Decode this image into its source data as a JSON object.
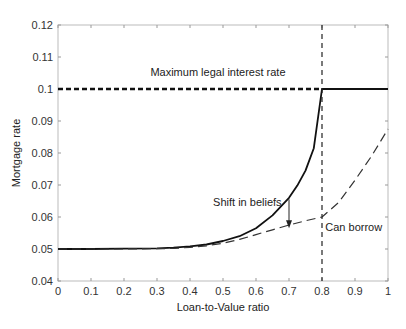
{
  "chart_data": {
    "type": "line",
    "title": "",
    "xlabel": "Loan-to-Value ratio",
    "ylabel": "Mortgage rate",
    "xlim": [
      0,
      1
    ],
    "ylim": [
      0.04,
      0.12
    ],
    "grid": false,
    "legend": "none",
    "x_ticks": [
      "0",
      "0.1",
      "0.2",
      "0.3",
      "0.4",
      "0.5",
      "0.6",
      "0.7",
      "0.8",
      "0.9",
      "1"
    ],
    "y_ticks": [
      "0.04",
      "0.05",
      "0.06",
      "0.07",
      "0.08",
      "0.09",
      "0.1",
      "0.11",
      "0.12"
    ],
    "series": [
      {
        "name": "Mortgage rate (before shift in beliefs)",
        "style": "solid",
        "x": [
          0,
          0.1,
          0.2,
          0.3,
          0.35,
          0.4,
          0.45,
          0.5,
          0.55,
          0.6,
          0.65,
          0.7,
          0.725,
          0.75,
          0.775,
          0.8,
          0.9,
          1.0
        ],
        "y": [
          0.05,
          0.05,
          0.0501,
          0.0502,
          0.0504,
          0.0508,
          0.0514,
          0.0525,
          0.054,
          0.0565,
          0.0605,
          0.066,
          0.0698,
          0.0745,
          0.0815,
          0.1,
          0.1,
          0.1
        ]
      },
      {
        "name": "Mortgage rate (after shift in beliefs)",
        "style": "dashed",
        "x": [
          0,
          0.1,
          0.2,
          0.3,
          0.35,
          0.4,
          0.45,
          0.5,
          0.55,
          0.6,
          0.65,
          0.7,
          0.75,
          0.8,
          0.85,
          0.9,
          0.95,
          1.0
        ],
        "y": [
          0.05,
          0.05,
          0.05,
          0.0501,
          0.0502,
          0.0505,
          0.051,
          0.0518,
          0.053,
          0.0545,
          0.056,
          0.0575,
          0.0588,
          0.06,
          0.0645,
          0.0715,
          0.079,
          0.0875
        ]
      },
      {
        "name": "Maximum legal interest rate",
        "style": "dotted",
        "x": [
          0,
          0.8
        ],
        "y": [
          0.1,
          0.1
        ]
      }
    ],
    "reference_lines": [
      {
        "type": "vertical",
        "x": 0.8,
        "style": "dashed",
        "label": "Can borrow"
      }
    ],
    "annotations": [
      {
        "text": "Maximum legal interest rate",
        "x": 0.28,
        "y": 0.104
      },
      {
        "text": "Shift in beliefs",
        "x": 0.47,
        "y": 0.0635
      },
      {
        "text": "Can borrow",
        "x": 0.81,
        "y": 0.0555
      },
      {
        "type": "arrow",
        "x": 0.7,
        "y_from": 0.0655,
        "y_to": 0.0565
      }
    ]
  },
  "labels": {
    "max_rate": "Maximum legal interest rate",
    "shift": "Shift in beliefs",
    "can_borrow": "Can borrow"
  }
}
